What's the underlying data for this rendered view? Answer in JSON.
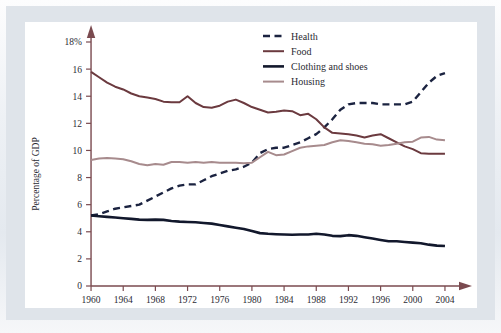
{
  "figure": {
    "background_color": "#e4e9ef",
    "panel_color": "#ffffff",
    "axis_color": "#7a4a4f",
    "text_color": "#2b2b33"
  },
  "chart_data": {
    "type": "line",
    "title": "",
    "xlabel": "",
    "ylabel": "Percentage of GDP",
    "xlim": [
      1959,
      2005
    ],
    "ylim": [
      0,
      18
    ],
    "grid": false,
    "legend_position": "top-right",
    "ytick_labels": [
      "0",
      "2",
      "4",
      "6",
      "8",
      "10",
      "12",
      "14",
      "16",
      "18%"
    ],
    "yticks": [
      0,
      2,
      4,
      6,
      8,
      10,
      12,
      14,
      16,
      18
    ],
    "xtick_labels": [
      "1960",
      "1964",
      "1968",
      "1972",
      "1976",
      "1980",
      "1984",
      "1988",
      "1992",
      "1996",
      "2000",
      "2004"
    ],
    "xticks": [
      1960,
      1964,
      1968,
      1972,
      1976,
      1980,
      1984,
      1988,
      1992,
      1996,
      2000,
      2004
    ],
    "x": [
      1960,
      1961,
      1962,
      1963,
      1964,
      1965,
      1966,
      1967,
      1968,
      1969,
      1970,
      1971,
      1972,
      1973,
      1974,
      1975,
      1976,
      1977,
      1978,
      1979,
      1980,
      1981,
      1982,
      1983,
      1984,
      1985,
      1986,
      1987,
      1988,
      1989,
      1990,
      1991,
      1992,
      1993,
      1994,
      1995,
      1996,
      1997,
      1998,
      1999,
      2000,
      2001,
      2002,
      2003,
      2004
    ],
    "series": [
      {
        "name": "Health",
        "color": "#1b2340",
        "style": "dashed",
        "width": 2.4,
        "values": [
          5.2,
          5.3,
          5.5,
          5.7,
          5.8,
          5.9,
          6.0,
          6.3,
          6.6,
          6.9,
          7.2,
          7.4,
          7.5,
          7.5,
          7.8,
          8.1,
          8.3,
          8.5,
          8.6,
          8.8,
          9.1,
          9.8,
          10.1,
          10.2,
          10.2,
          10.4,
          10.6,
          10.9,
          11.2,
          11.7,
          12.3,
          13.0,
          13.4,
          13.5,
          13.5,
          13.5,
          13.4,
          13.4,
          13.4,
          13.4,
          13.6,
          14.3,
          15.0,
          15.5,
          15.7
        ]
      },
      {
        "name": "Food",
        "color": "#6b3a3f",
        "style": "solid",
        "width": 2.0,
        "values": [
          15.8,
          15.4,
          15.0,
          14.7,
          14.5,
          14.2,
          14.0,
          13.9,
          13.8,
          13.6,
          13.55,
          13.55,
          14.0,
          13.5,
          13.2,
          13.15,
          13.3,
          13.6,
          13.75,
          13.5,
          13.2,
          13.0,
          12.8,
          12.85,
          12.95,
          12.9,
          12.6,
          12.7,
          12.3,
          11.7,
          11.3,
          11.25,
          11.2,
          11.1,
          10.95,
          11.1,
          11.2,
          10.9,
          10.6,
          10.3,
          10.1,
          9.8,
          9.75,
          9.75,
          9.75
        ]
      },
      {
        "name": "Clothing and shoes",
        "color": "#12182c",
        "style": "solid",
        "width": 2.6,
        "values": [
          5.2,
          5.15,
          5.1,
          5.05,
          5.0,
          4.95,
          4.9,
          4.88,
          4.9,
          4.88,
          4.8,
          4.75,
          4.72,
          4.7,
          4.65,
          4.6,
          4.5,
          4.4,
          4.3,
          4.2,
          4.05,
          3.9,
          3.85,
          3.82,
          3.8,
          3.78,
          3.8,
          3.8,
          3.85,
          3.8,
          3.7,
          3.68,
          3.75,
          3.7,
          3.6,
          3.5,
          3.4,
          3.3,
          3.3,
          3.25,
          3.2,
          3.15,
          3.05,
          2.98,
          2.95
        ]
      },
      {
        "name": "Housing",
        "color": "#a78b8d",
        "style": "solid",
        "width": 2.0,
        "values": [
          9.3,
          9.4,
          9.45,
          9.4,
          9.35,
          9.2,
          9.0,
          8.9,
          9.0,
          8.95,
          9.15,
          9.15,
          9.1,
          9.15,
          9.1,
          9.15,
          9.1,
          9.1,
          9.1,
          9.05,
          9.1,
          9.5,
          9.9,
          9.65,
          9.7,
          9.95,
          10.2,
          10.3,
          10.35,
          10.4,
          10.6,
          10.75,
          10.7,
          10.6,
          10.5,
          10.45,
          10.35,
          10.4,
          10.5,
          10.6,
          10.65,
          10.95,
          11.0,
          10.8,
          10.75
        ]
      }
    ]
  },
  "legend": {
    "entries": [
      {
        "label": "Health"
      },
      {
        "label": "Food"
      },
      {
        "label": "Clothing and shoes"
      },
      {
        "label": "Housing"
      }
    ]
  }
}
